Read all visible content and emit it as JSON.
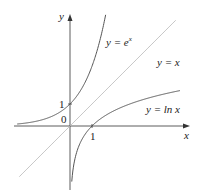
{
  "chart_data": {
    "type": "line",
    "title": "",
    "xlabel": "x",
    "ylabel": "y",
    "origin_label": "0",
    "x_tick_labels": [
      "1"
    ],
    "y_tick_labels": [
      "1"
    ],
    "xlim": [
      -2.4,
      4.5
    ],
    "ylim": [
      -2.8,
      5.3
    ],
    "grid": false,
    "legend": "inline labels",
    "series": [
      {
        "name": "y = e^x",
        "label_text": "y = e",
        "label_sup": "x",
        "color": "#555555",
        "function": "exp",
        "x_range": [
          -2.4,
          1.62
        ]
      },
      {
        "name": "y = x",
        "label_text": "y = x",
        "color": "#bbbbbb",
        "function": "identity",
        "x_range": [
          -2.3,
          4.8
        ]
      },
      {
        "name": "y = ln x",
        "label_text": "y = ln x",
        "color": "#555555",
        "function": "ln",
        "x_range": [
          0.08,
          5.0
        ]
      }
    ],
    "colors": {
      "axis": "#333333",
      "curve": "#555555",
      "identity_line": "#bbbbbb"
    }
  }
}
